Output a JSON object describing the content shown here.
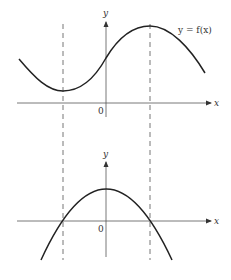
{
  "figure": {
    "top_graph": {
      "function_label": "y = f(x)",
      "x_axis_label": "x",
      "y_axis_label": "y",
      "origin_label": "0",
      "curve_description": "sinusoidal-like curve with local minimum at left dashed line and local maximum at right dashed line"
    },
    "bottom_graph": {
      "x_axis_label": "x",
      "y_axis_label": "y",
      "origin_label": "0",
      "curve_description": "downward parabola crossing x-axis at the two dashed lines (derivative of f)"
    },
    "dashed_lines": {
      "count": 2,
      "description": "vertical dashed guide lines through critical points of f"
    },
    "colors": {
      "curve": "#222222",
      "axis": "#555555",
      "dash": "#666666",
      "background": "#ffffff"
    }
  }
}
